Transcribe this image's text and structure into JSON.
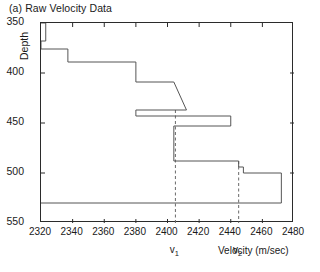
{
  "figure": {
    "title": "(a) Raw Velocity Data"
  },
  "chart_data": {
    "type": "line",
    "title": "(a) Raw Velocity Data",
    "xlabel": "Velocity (m/sec)",
    "ylabel": "Depth",
    "xlim": [
      2320,
      2480
    ],
    "ylim": [
      550,
      350
    ],
    "y_inverted": true,
    "grid": false,
    "legend": null,
    "xticks": [
      2320,
      2340,
      2360,
      2380,
      2400,
      2420,
      2440,
      2460,
      2480
    ],
    "xticklabels": [
      "2320",
      "2340",
      "2360",
      "2380",
      "2400",
      "2420",
      "2440",
      "2460",
      "2480"
    ],
    "yticks": [
      350,
      400,
      450,
      500,
      550
    ],
    "yticklabels": [
      "350",
      "400",
      "450",
      "500",
      "550"
    ],
    "series": [
      {
        "name": "raw velocity log",
        "x": [
          2320,
          2323,
          2323,
          2320,
          2320,
          2337,
          2337,
          2380,
          2380,
          2404,
          2412,
          2380,
          2380,
          2440,
          2440,
          2404,
          2404,
          2445,
          2445,
          2448,
          2448,
          2472,
          2472,
          2320
        ],
        "y": [
          350,
          350,
          368,
          368,
          376,
          376,
          389,
          389,
          409,
          409,
          437,
          437,
          443,
          443,
          453,
          453,
          488,
          488,
          494,
          494,
          500,
          500,
          530,
          530
        ],
        "style": "solid",
        "color": "#555555"
      }
    ],
    "annotations": [
      {
        "name": "v1",
        "label": "v",
        "subscript": "1",
        "x": 2405,
        "type": "vertical-dashed-line",
        "y_from": 550,
        "y_to": 437
      },
      {
        "name": "v2",
        "label": "v",
        "subscript": "2",
        "x": 2445,
        "type": "vertical-dashed-line",
        "y_from": 550,
        "y_to": 488
      }
    ]
  },
  "colors": {
    "axis": "#2b2b2b",
    "data_line": "#555555",
    "dashed_line": "#6a6a6a",
    "text": "#1a1a1a",
    "background": "#ffffff"
  },
  "axis_titles": {
    "x": "Velocity (m/sec)",
    "y": "Depth"
  }
}
